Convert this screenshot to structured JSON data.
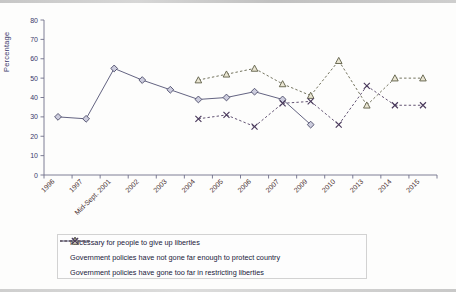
{
  "chart_data": {
    "type": "line",
    "title": "",
    "xlabel": "",
    "ylabel": "Percentage",
    "ylim": [
      0,
      80
    ],
    "ytick_step": 10,
    "grid": false,
    "legend_position": "bottom",
    "categories": [
      "1996",
      "1997",
      "Mid-Sept. 2001",
      "2002",
      "2003",
      "2004",
      "2005",
      "2006",
      "2007",
      "2009",
      "2010",
      "2013",
      "2014",
      "2015"
    ],
    "yticks": [
      "0",
      "10",
      "20",
      "30",
      "40",
      "50",
      "60",
      "70",
      "80"
    ],
    "series": [
      {
        "name": "Necessary for people to give up liberties",
        "marker": "diamond",
        "linestyle": "solid",
        "color": "#5b5b7a",
        "values": [
          30,
          29,
          55,
          49,
          44,
          39,
          40,
          43,
          39,
          26,
          null,
          null,
          null,
          null
        ]
      },
      {
        "name": "Government policies have not gone far enough to protect country",
        "marker": "triangle",
        "linestyle": "dashed",
        "color": "#6b6b55",
        "values": [
          null,
          null,
          null,
          null,
          null,
          49,
          52,
          55,
          47,
          41,
          59,
          36,
          50,
          50
        ]
      },
      {
        "name": "Government policies have gone too far in restricting liberties",
        "marker": "x",
        "linestyle": "dashed",
        "color": "#5a4a6b",
        "values": [
          null,
          null,
          null,
          null,
          null,
          29,
          31,
          25,
          37,
          38,
          26,
          46,
          36,
          36
        ]
      }
    ]
  },
  "legend": {
    "items": [
      {
        "label": "Necessary for people to give up liberties",
        "key": "diamond-solid-key"
      },
      {
        "label": "Government policies have not gone far enough to protect country",
        "key": "triangle-dashed-key"
      },
      {
        "label": "Government policies have gone too far in restricting liberties",
        "key": "x-dashed-key"
      }
    ]
  },
  "axis": {
    "y_title": "Percentage"
  }
}
